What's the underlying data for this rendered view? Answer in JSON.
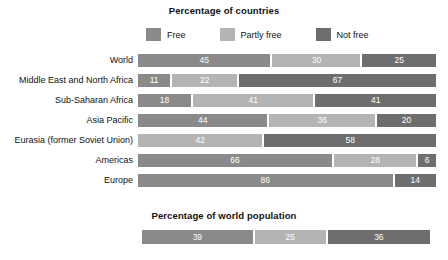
{
  "chart_data": {
    "type": "bar",
    "subtype": "stacked-horizontal-100pct",
    "title": "Percentage of countries",
    "xlabel": "",
    "ylabel": "",
    "xlim": [
      0,
      100
    ],
    "grid": false,
    "legend_position": "top",
    "legend": [
      "Free",
      "Partly free",
      "Not free"
    ],
    "series": [
      {
        "name": "Free",
        "color": "#8a8a8a",
        "values": [
          45,
          11,
          18,
          44,
          0,
          66,
          86
        ]
      },
      {
        "name": "Partly free",
        "color": "#b4b4b4",
        "values": [
          30,
          22,
          41,
          36,
          42,
          28,
          0
        ]
      },
      {
        "name": "Not free",
        "color": "#6e6e6e",
        "values": [
          25,
          67,
          41,
          20,
          58,
          6,
          14
        ]
      }
    ],
    "categories": [
      "World",
      "Middle East and North Africa",
      "Sub-Saharan Africa",
      "Asia Pacific",
      "Eurasia (former Soviet Union)",
      "Americas",
      "Europe"
    ],
    "secondary_chart": {
      "type": "bar",
      "subtype": "stacked-horizontal-100pct",
      "title": "Percentage of world population",
      "categories": [
        "World population"
      ],
      "legend": [
        "Free",
        "Partly free",
        "Not free"
      ],
      "series": [
        {
          "name": "Free",
          "color": "#8a8a8a",
          "values": [
            39
          ]
        },
        {
          "name": "Partly free",
          "color": "#b4b4b4",
          "values": [
            25
          ]
        },
        {
          "name": "Not free",
          "color": "#6e6e6e",
          "values": [
            36
          ]
        }
      ]
    }
  },
  "titles": {
    "countries": "Percentage of countries",
    "population": "Percentage of world population"
  },
  "colors": {
    "free": "#8a8a8a",
    "partly_free": "#b4b4b4",
    "not_free": "#6e6e6e",
    "background": "#ffffff",
    "text": "#111111",
    "value_text": "#ffffff"
  },
  "legend": {
    "items": [
      {
        "label": "Free",
        "swatch": "legend-swatch-free"
      },
      {
        "label": "Partly free",
        "swatch": "legend-swatch-partly-free"
      },
      {
        "label": "Not free",
        "swatch": "legend-swatch-not-free"
      }
    ]
  },
  "rows": [
    {
      "label": "World",
      "segments": [
        {
          "key": "free",
          "value": 45,
          "display": "45"
        },
        {
          "key": "partly_free",
          "value": 30,
          "display": "30"
        },
        {
          "key": "not_free",
          "value": 25,
          "display": "25"
        }
      ]
    },
    {
      "label": "Middle East and North Africa",
      "segments": [
        {
          "key": "free",
          "value": 11,
          "display": "11"
        },
        {
          "key": "partly_free",
          "value": 22,
          "display": "22"
        },
        {
          "key": "not_free",
          "value": 67,
          "display": "67"
        }
      ]
    },
    {
      "label": "Sub-Saharan Africa",
      "segments": [
        {
          "key": "free",
          "value": 18,
          "display": "18"
        },
        {
          "key": "partly_free",
          "value": 41,
          "display": "41"
        },
        {
          "key": "not_free",
          "value": 41,
          "display": "41"
        }
      ]
    },
    {
      "label": "Asia Pacific",
      "segments": [
        {
          "key": "free",
          "value": 44,
          "display": "44"
        },
        {
          "key": "partly_free",
          "value": 36,
          "display": "36"
        },
        {
          "key": "not_free",
          "value": 20,
          "display": "20"
        }
      ]
    },
    {
      "label": "Eurasia (former Soviet Union)",
      "segments": [
        {
          "key": "partly_free",
          "value": 42,
          "display": "42"
        },
        {
          "key": "not_free",
          "value": 58,
          "display": "58"
        }
      ]
    },
    {
      "label": "Americas",
      "segments": [
        {
          "key": "free",
          "value": 66,
          "display": "66"
        },
        {
          "key": "partly_free",
          "value": 28,
          "display": "28"
        },
        {
          "key": "not_free",
          "value": 6,
          "display": "6"
        }
      ]
    },
    {
      "label": "Europe",
      "segments": [
        {
          "key": "free",
          "value": 86,
          "display": "86"
        },
        {
          "key": "not_free",
          "value": 14,
          "display": "14"
        }
      ]
    }
  ],
  "population_row": {
    "segments": [
      {
        "key": "free",
        "value": 39,
        "display": "39"
      },
      {
        "key": "partly_free",
        "value": 25,
        "display": "25"
      },
      {
        "key": "not_free",
        "value": 36,
        "display": "36"
      }
    ]
  }
}
